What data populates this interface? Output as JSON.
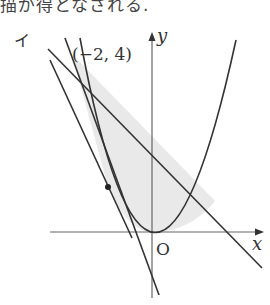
{
  "header": {
    "clipped_text": "描が得となされる."
  },
  "figure": {
    "part_label": "イ",
    "point_label": "(−2, 4)",
    "axis_x_label": "x",
    "axis_y_label": "y",
    "origin_label": "O",
    "colors": {
      "stroke": "#333333",
      "axis": "#555555",
      "shade": "#e8e8e8"
    },
    "elements": [
      {
        "type": "parabola",
        "equation": "y = a x^2",
        "vertex": "O"
      },
      {
        "type": "line",
        "desc": "steep tangent line"
      },
      {
        "type": "line",
        "desc": "line through (−2,4) with negative slope"
      },
      {
        "type": "line",
        "desc": "tangent line at marked point"
      },
      {
        "type": "point",
        "desc": "tangent point on parabola"
      },
      {
        "type": "shaded_region",
        "desc": "region bounded by parabola and lines"
      }
    ]
  }
}
